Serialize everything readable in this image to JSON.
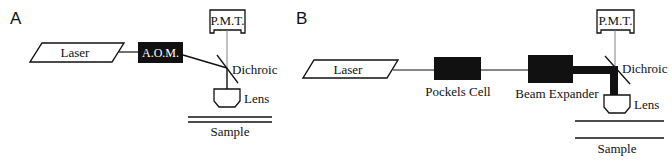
{
  "panels": {
    "a": {
      "label": "A",
      "laser": "Laser",
      "aom": "A.O.M.",
      "pmt": "P.M.T.",
      "dichroic": "Dichroic",
      "lens": "Lens",
      "sample": "Sample"
    },
    "b": {
      "label": "B",
      "laser": "Laser",
      "pockels": "Pockels Cell",
      "expander": "Beam Expander",
      "pmt": "P.M.T.",
      "dichroic": "Dichroic",
      "lens": "Lens",
      "sample": "Sample"
    }
  },
  "colors": {
    "ink": "#111111",
    "background": "#ffffff",
    "pmt_line": "#777777"
  }
}
